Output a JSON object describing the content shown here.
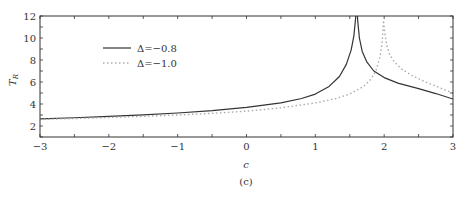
{
  "chart_data": {
    "type": "line",
    "title": "",
    "subtitle": "(c)",
    "xlabel": "c",
    "ylabel": "T_R",
    "xlim": [
      -3,
      3
    ],
    "ylim": [
      1,
      12
    ],
    "xticks": [
      -3,
      -2,
      -1,
      0,
      1,
      2,
      3
    ],
    "yticks": [
      2,
      4,
      6,
      8,
      10,
      12
    ],
    "grid": false,
    "legend_position": "upper-left",
    "series": [
      {
        "name": "Δ=−0.8",
        "style": "solid",
        "color": "#333333",
        "x": [
          -3,
          -2.5,
          -2,
          -1.5,
          -1,
          -0.5,
          0,
          0.5,
          0.8,
          1.0,
          1.2,
          1.35,
          1.45,
          1.52,
          1.56,
          1.585,
          1.6,
          1.615,
          1.64,
          1.68,
          1.75,
          1.85,
          2.0,
          2.2,
          2.5,
          2.75,
          3.0
        ],
        "y": [
          2.65,
          2.75,
          2.88,
          3.02,
          3.18,
          3.4,
          3.7,
          4.1,
          4.5,
          4.9,
          5.6,
          6.5,
          7.6,
          8.9,
          10.2,
          11.8,
          13.5,
          11.6,
          10.0,
          8.8,
          7.8,
          7.0,
          6.4,
          5.9,
          5.4,
          4.95,
          4.45
        ]
      },
      {
        "name": "Δ=−1.0",
        "style": "dotted",
        "color": "#aaaaaa",
        "x": [
          -3,
          -2.5,
          -2,
          -1.5,
          -1,
          -0.5,
          0,
          0.5,
          1.0,
          1.3,
          1.5,
          1.7,
          1.8,
          1.88,
          1.94,
          1.97,
          1.99,
          2.01,
          2.04,
          2.08,
          2.15,
          2.25,
          2.4,
          2.6,
          2.8,
          3.0
        ],
        "y": [
          2.6,
          2.68,
          2.77,
          2.88,
          3.0,
          3.15,
          3.35,
          3.65,
          4.1,
          4.5,
          4.9,
          5.6,
          6.2,
          7.0,
          8.3,
          9.5,
          11.6,
          10.4,
          9.3,
          8.5,
          7.8,
          7.2,
          6.6,
          6.0,
          5.5,
          5.0
        ]
      }
    ]
  },
  "legend": {
    "items": [
      {
        "label": "Δ=−0.8",
        "style": "solid"
      },
      {
        "label": "Δ=−1.0",
        "style": "dotted"
      }
    ]
  },
  "labels": {
    "xlabel": "c",
    "ylabel_main": "T",
    "ylabel_sub": "R",
    "caption": "(c)"
  }
}
